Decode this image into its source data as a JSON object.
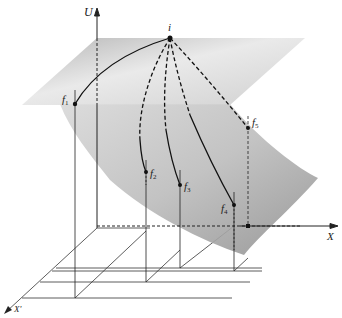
{
  "diagram": {
    "title": "",
    "axes": {
      "vertical": "U",
      "horizontal": "X",
      "depth": "X'"
    },
    "points": {
      "initial": "i",
      "finals": [
        {
          "base": "f",
          "sub": "1"
        },
        {
          "base": "f",
          "sub": "2"
        },
        {
          "base": "f",
          "sub": "3"
        },
        {
          "base": "f",
          "sub": "4"
        },
        {
          "base": "f",
          "sub": "5"
        }
      ]
    },
    "paths": [
      {
        "from": "i",
        "to": "f1",
        "style": "solid"
      },
      {
        "from": "i",
        "to": "f2",
        "style": "dashed-then-solid"
      },
      {
        "from": "i",
        "to": "f3",
        "style": "dashed-then-solid"
      },
      {
        "from": "i",
        "to": "f4",
        "style": "dashed-then-solid"
      },
      {
        "from": "i",
        "to": "f5",
        "style": "dashed"
      }
    ],
    "colors": {
      "surface": "#9a9a9a",
      "plane": "#bdbdbd",
      "line": "#222222"
    }
  }
}
